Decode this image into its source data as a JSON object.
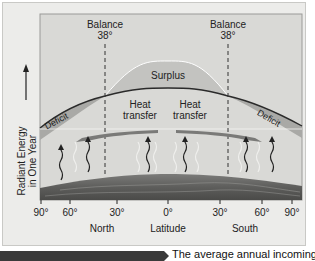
{
  "diagram": {
    "balance_left": {
      "label": "Balance",
      "value": "38°"
    },
    "balance_right": {
      "label": "Balance",
      "value": "38°"
    },
    "surplus_label": "Surplus",
    "deficit_left": "Deficit",
    "deficit_right": "Deficit",
    "heat_transfer_left": {
      "line1": "Heat",
      "line2": "transfer"
    },
    "heat_transfer_right": {
      "line1": "Heat",
      "line2": "transfer"
    },
    "y_axis_label": {
      "line1": "Radiant Energy",
      "line2": "in One Year"
    },
    "x_ticks": [
      "90°",
      "60°",
      "30°",
      "0°",
      "30°",
      "60°",
      "90°"
    ],
    "x_region_labels": {
      "north": "North",
      "center": "Latitude",
      "south": "South"
    },
    "colors": {
      "panel": "#ececea",
      "plot_bg": "#d9d9d6",
      "surplus_fill": "#c3c3c0",
      "deficit_fill": "#a9a9a6",
      "curve": "#2a2a2a",
      "arrow": "#777777",
      "ground": "#6c6c6a"
    }
  },
  "caption": {
    "text": "The average annual incoming"
  }
}
